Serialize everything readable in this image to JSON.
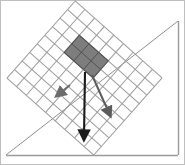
{
  "figure": {
    "title": "",
    "width": 185,
    "height": 165,
    "background_color": "#ffffff"
  },
  "border": {
    "name": "figure-frame",
    "color": "#b4b4b4",
    "width": 1
  },
  "ground_plane": {
    "name": "inclined-plane",
    "color": "#8c8c8c",
    "stroke_width": 1,
    "apex": {
      "x": 178,
      "y": 21
    },
    "bottom_left": {
      "x": 6,
      "y": 155
    },
    "bottom_right": {
      "x": 178,
      "y": 155
    },
    "label": ""
  },
  "grid": {
    "name": "mesh-grid",
    "line_color": "#9a9a9a",
    "line_width": 1,
    "columns": 9,
    "rows": 9,
    "rotation_deg": 42,
    "corners": {
      "left": {
        "x": 17,
        "y": 60
      },
      "top": {
        "x": 88,
        "y": 3
      },
      "right": {
        "x": 152,
        "y": 100
      },
      "bottom": {
        "x": 80,
        "y": 153
      }
    }
  },
  "shaded_block": {
    "name": "loaded-region",
    "fill_color": "#7d7d7d",
    "stroke_color": "#4a4a4a",
    "rows": 2,
    "columns": 3,
    "opacity": 1,
    "label": ""
  },
  "arrows": [
    {
      "name": "load-arrow-vertical",
      "direction": "down",
      "color": "#1a1a1a",
      "stroke_width": 2,
      "from": {
        "x": 85,
        "y": 74
      },
      "to": {
        "x": 84,
        "y": 140
      },
      "label": ""
    },
    {
      "name": "load-arrow-diagonal-right",
      "direction": "down-right",
      "color": "#555555",
      "stroke_width": 2,
      "from": {
        "x": 92,
        "y": 75
      },
      "to": {
        "x": 110,
        "y": 118
      },
      "label": ""
    },
    {
      "name": "load-arrow-left",
      "direction": "down-left",
      "color": "#555555",
      "stroke_width": 2,
      "from": {
        "x": 67,
        "y": 88
      },
      "to": {
        "x": 58,
        "y": 96
      },
      "label": ""
    }
  ]
}
